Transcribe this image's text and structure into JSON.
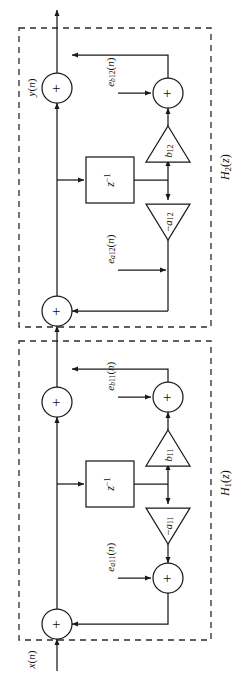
{
  "figure": {
    "kind": "block-diagram",
    "orientation": "rotated-90-ccw"
  },
  "signals": {
    "input_label": "x(n)",
    "output_label": "y(n)"
  },
  "sections": [
    {
      "id": "H1",
      "label": "H1(z)",
      "label_base": "H",
      "label_sub": "1",
      "label_tail": "(z)",
      "delay_label": "z",
      "delay_exponent": "-1",
      "feedforward_gain": "b11",
      "feedforward_base": "b",
      "feedforward_sub": "11",
      "feedback_gain": "-a11",
      "feedback_base": "-a",
      "feedback_sub": "11",
      "noise_feedback": "ea11(n)",
      "noise_feedback_base": "e",
      "noise_feedback_sub": "a11",
      "noise_feedback_tail": "(n)",
      "noise_feedforward": "eb11(n)",
      "noise_feedforward_base": "e",
      "noise_feedforward_sub": "b11",
      "noise_feedforward_tail": "(n)",
      "adders": [
        "+",
        "+",
        "+",
        "+"
      ]
    },
    {
      "id": "H2",
      "label": "H2(z)",
      "label_base": "H",
      "label_sub": "2",
      "label_tail": "(z)",
      "delay_label": "z",
      "delay_exponent": "-1",
      "feedforward_gain": "b12",
      "feedforward_base": "b",
      "feedforward_sub": "12",
      "feedback_gain": "-a12",
      "feedback_base": "-a",
      "feedback_sub": "12",
      "noise_feedback": "ea12(n)",
      "noise_feedback_base": "e",
      "noise_feedback_sub": "a12",
      "noise_feedback_tail": "(n)",
      "noise_feedforward": "eb12(n)",
      "noise_feedforward_base": "e",
      "noise_feedforward_sub": "b12",
      "noise_feedforward_tail": "(n)",
      "adders": [
        "+",
        "+",
        "+",
        "+"
      ]
    }
  ],
  "symbols": {
    "plus": "+",
    "minus": "−"
  },
  "colors": {
    "line": "#1a1a1a",
    "dashed_box": "#2b2b2b",
    "background": "#ffffff"
  }
}
